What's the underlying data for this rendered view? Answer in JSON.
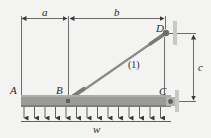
{
  "diagram": {
    "type": "statics beam with tie rod",
    "labels": {
      "a": "a",
      "b": "b",
      "c": "c",
      "w": "w",
      "A": "A",
      "B": "B",
      "C": "C",
      "D": "D",
      "member": "(1)"
    },
    "colors": {
      "background": "#f3f3f2",
      "beam": "#9a9a98",
      "beam_edge": "#7e7e7c",
      "wall_plate": "#c8c8c6",
      "pin": "#6e6e6c",
      "line": "#4a4a4a",
      "rod": "#8a8a88",
      "text": "#2a2a2a"
    },
    "load": {
      "arrow_count": 11,
      "distributed": true
    }
  }
}
